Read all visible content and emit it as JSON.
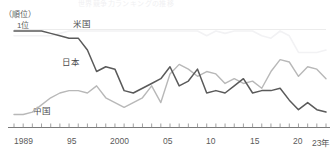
{
  "figure": {
    "cut_title": "世界競争力ランキングの推移",
    "y_axis_unit": "（順位）",
    "rank_top_label": "1位"
  },
  "labels": {
    "us": "米国",
    "jp": "日本",
    "cn": "中国"
  },
  "ticks": [
    {
      "label": "1989",
      "x": 14
    },
    {
      "label": "95",
      "x": 67
    },
    {
      "label": "2000",
      "x": 110
    },
    {
      "label": "05",
      "x": 163
    },
    {
      "label": "10",
      "x": 206
    },
    {
      "label": "15",
      "x": 250
    },
    {
      "label": "20",
      "x": 293
    },
    {
      "label": "23年",
      "x": 312
    }
  ],
  "colors": {
    "japan_line": "#5a5a5a",
    "china_line": "#b8b8b8",
    "us_line": "#f2f2f4",
    "axis": "#7a7a7a",
    "text": "#4a4a4a"
  },
  "chart_data": {
    "type": "line",
    "title": "世界競争力ランキングの推移",
    "xlabel": "年",
    "ylabel": "（順位）",
    "ylim": [
      1,
      40
    ],
    "y_inverted": true,
    "grid": false,
    "legend": "inline-labels",
    "x": [
      1989,
      1990,
      1991,
      1992,
      1993,
      1994,
      1995,
      1996,
      1997,
      1998,
      1999,
      2000,
      2001,
      2002,
      2003,
      2004,
      2005,
      2006,
      2007,
      2008,
      2009,
      2010,
      2011,
      2012,
      2013,
      2014,
      2015,
      2016,
      2017,
      2018,
      2019,
      2020,
      2021,
      2022,
      2023
    ],
    "series": [
      {
        "name": "米国",
        "color": "#f2f2f4",
        "values": [
          3,
          3,
          3,
          3,
          3,
          2,
          1,
          1,
          1,
          1,
          1,
          1,
          1,
          1,
          1,
          1,
          1,
          1,
          1,
          1,
          1,
          3,
          1,
          2,
          1,
          1,
          1,
          3,
          4,
          1,
          3,
          10,
          10,
          10,
          9
        ]
      },
      {
        "name": "日本",
        "color": "#5a5a5a",
        "values": [
          1,
          1,
          1,
          1,
          2,
          3,
          4,
          4,
          9,
          18,
          16,
          17,
          26,
          27,
          25,
          23,
          21,
          16,
          24,
          22,
          17,
          27,
          26,
          27,
          24,
          21,
          27,
          26,
          26,
          25,
          30,
          34,
          31,
          34,
          35
        ]
      },
      {
        "name": "中国",
        "color": "#b8b8b8",
        "values": [
          36,
          36,
          35,
          32,
          29,
          27,
          26,
          26,
          27,
          24,
          29,
          31,
          33,
          31,
          29,
          24,
          31,
          19,
          15,
          17,
          20,
          18,
          19,
          23,
          21,
          23,
          22,
          25,
          18,
          13,
          14,
          20,
          16,
          17,
          21
        ]
      }
    ]
  }
}
